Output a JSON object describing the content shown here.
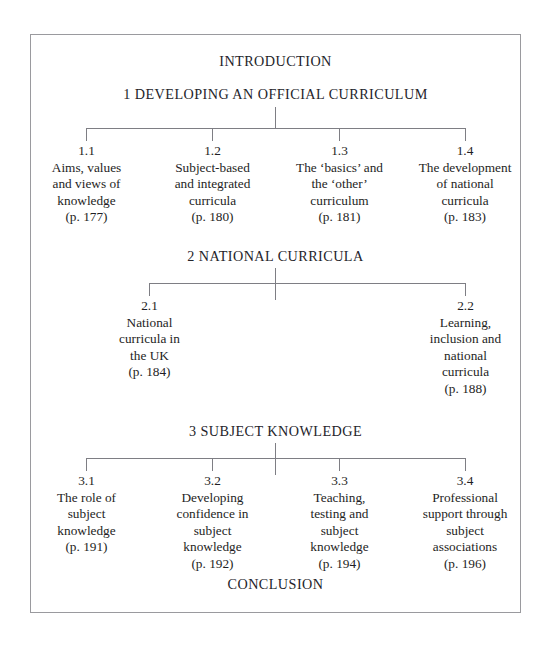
{
  "document": {
    "title": "Chapter contents structure diagram"
  },
  "top_heading": "INTRODUCTION",
  "bottom_heading": "CONCLUSION",
  "sections": [
    {
      "heading": "1 DEVELOPING AN OFFICIAL CURRICULUM",
      "nodes": [
        {
          "number": "1.1",
          "title": "Aims, values\nand views of\nknowledge",
          "page": "(p. 177)"
        },
        {
          "number": "1.2",
          "title": "Subject-based\nand integrated\ncurricula",
          "page": "(p. 180)"
        },
        {
          "number": "1.3",
          "title": "The ‘basics’ and\nthe ‘other’\ncurriculum",
          "page": "(p. 181)"
        },
        {
          "number": "1.4",
          "title": "The development\nof national\ncurricula",
          "page": "(p. 183)"
        }
      ]
    },
    {
      "heading": "2 NATIONAL CURRICULA",
      "nodes": [
        {
          "number": "2.1",
          "title": "National\ncurricula in\nthe UK",
          "page": "(p. 184)"
        },
        {
          "number": "2.2",
          "title": "Learning,\ninclusion and\nnational\ncurricula",
          "page": "(p. 188)"
        }
      ]
    },
    {
      "heading": "3 SUBJECT KNOWLEDGE",
      "nodes": [
        {
          "number": "3.1",
          "title": "The role of\nsubject\nknowledge",
          "page": "(p. 191)"
        },
        {
          "number": "3.2",
          "title": "Developing\nconfidence in\nsubject\nknowledge",
          "page": "(p. 192)"
        },
        {
          "number": "3.3",
          "title": "Teaching,\ntesting and\nsubject\nknowledge",
          "page": "(p. 194)"
        },
        {
          "number": "3.4",
          "title": "Professional\nsupport through\nsubject\nassociations",
          "page": "(p. 196)"
        }
      ]
    }
  ],
  "colors": {
    "page_background": "#ffffff",
    "frame_border": "#9a9a9e",
    "connector_line": "#7e7e84",
    "text": "#1e1e24"
  }
}
